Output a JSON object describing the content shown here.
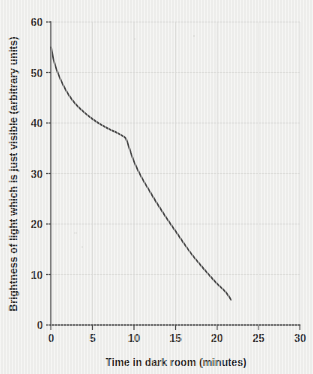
{
  "figure": {
    "background_color": "#efefed",
    "curve_color": "#4a4a4a",
    "axis_color": "#4e4e4e",
    "grid_color": "#dcdcda"
  },
  "chart_data": {
    "type": "line",
    "title": "",
    "subtitle": "",
    "xlabel": "Time in dark room (minutes)",
    "ylabel": "Brightness of light which is just visible (arbitrary units)",
    "xlim": [
      0,
      30
    ],
    "ylim": [
      0,
      60
    ],
    "xticks": [
      0,
      5,
      10,
      15,
      20,
      25,
      30
    ],
    "yticks": [
      0,
      10,
      20,
      30,
      40,
      50,
      60
    ],
    "xtick_labels": [
      "0",
      "5",
      "10",
      "15",
      "20",
      "25",
      "30"
    ],
    "ytick_labels": [
      "0",
      "10",
      "20",
      "30",
      "40",
      "50",
      "60"
    ],
    "grid": true,
    "legend": "none",
    "annotations": [],
    "series": [
      {
        "name": "Dark adaptation curve",
        "x": [
          0.0,
          0.4,
          0.9,
          1.5,
          2.2,
          3.0,
          4.0,
          5.0,
          6.0,
          7.0,
          8.0,
          9.0,
          9.2,
          9.6,
          10.2,
          11.0,
          12.0,
          13.0,
          14.0,
          15.0,
          16.0,
          17.0,
          18.0,
          19.0,
          20.0,
          21.0,
          21.7
        ],
        "y": [
          55.0,
          52.0,
          49.6,
          47.4,
          45.4,
          43.7,
          42.1,
          40.8,
          39.7,
          38.8,
          38.0,
          37.0,
          36.2,
          34.2,
          31.6,
          29.0,
          26.2,
          23.5,
          21.0,
          18.6,
          16.2,
          13.9,
          11.9,
          10.0,
          8.2,
          6.6,
          5.0
        ]
      }
    ]
  },
  "plot_geometry": {
    "origin_x_px": 51,
    "origin_y_px": 325,
    "x_max_px": 300,
    "y_max_px": 22
  }
}
